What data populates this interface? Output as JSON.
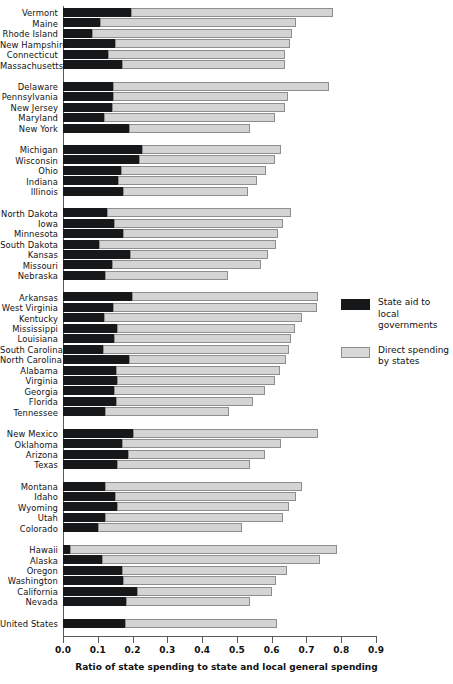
{
  "chart_data": {
    "type": "bar",
    "orientation": "horizontal",
    "stacked": true,
    "title": "",
    "xlabel": "Ratio of state spending to state and local general spending",
    "ylabel": "",
    "xlim": [
      0.0,
      0.9
    ],
    "xticks": [
      "0.0",
      "0.1",
      "0.2",
      "0.3",
      "0.4",
      "0.5",
      "0.6",
      "0.7",
      "0.8",
      "0.9"
    ],
    "grid": false,
    "legend_position": "right",
    "series": [
      {
        "name": "State aid to local governments",
        "color": "#17181a"
      },
      {
        "name": "Direct spending by states",
        "color": "#d4d4d4"
      }
    ],
    "groups": [
      {
        "name": "New England",
        "rows": [
          {
            "label": "Vermont",
            "aid": 0.195,
            "direct": 0.582,
            "total": 0.777
          },
          {
            "label": "Maine",
            "aid": 0.106,
            "direct": 0.564,
            "total": 0.67
          },
          {
            "label": "Rhode Island",
            "aid": 0.083,
            "direct": 0.575,
            "total": 0.658
          },
          {
            "label": "New Hampshire",
            "aid": 0.149,
            "direct": 0.503,
            "total": 0.652
          },
          {
            "label": "Connecticut",
            "aid": 0.13,
            "direct": 0.508,
            "total": 0.638
          },
          {
            "label": "Massachusetts",
            "aid": 0.17,
            "direct": 0.468,
            "total": 0.638
          }
        ]
      },
      {
        "name": "Mid-Atlantic",
        "rows": [
          {
            "label": "Delaware",
            "aid": 0.144,
            "direct": 0.621,
            "total": 0.765
          },
          {
            "label": "Pennsylvania",
            "aid": 0.144,
            "direct": 0.502,
            "total": 0.646
          },
          {
            "label": "New Jersey",
            "aid": 0.141,
            "direct": 0.497,
            "total": 0.638
          },
          {
            "label": "Maryland",
            "aid": 0.118,
            "direct": 0.492,
            "total": 0.61
          },
          {
            "label": "New York",
            "aid": 0.19,
            "direct": 0.348,
            "total": 0.538
          }
        ]
      },
      {
        "name": "Great Lakes",
        "rows": [
          {
            "label": "Michigan",
            "aid": 0.228,
            "direct": 0.399,
            "total": 0.627
          },
          {
            "label": "Wisconsin",
            "aid": 0.218,
            "direct": 0.392,
            "total": 0.61
          },
          {
            "label": "Ohio",
            "aid": 0.167,
            "direct": 0.417,
            "total": 0.584
          },
          {
            "label": "Indiana",
            "aid": 0.158,
            "direct": 0.4,
            "total": 0.558
          },
          {
            "label": "Illinois",
            "aid": 0.172,
            "direct": 0.36,
            "total": 0.532
          }
        ]
      },
      {
        "name": "Plains",
        "rows": [
          {
            "label": "North Dakota",
            "aid": 0.127,
            "direct": 0.528,
            "total": 0.655
          },
          {
            "label": "Iowa",
            "aid": 0.146,
            "direct": 0.486,
            "total": 0.632
          },
          {
            "label": "Minnesota",
            "aid": 0.172,
            "direct": 0.446,
            "total": 0.618
          },
          {
            "label": "South Dakota",
            "aid": 0.104,
            "direct": 0.508,
            "total": 0.612
          },
          {
            "label": "Kansas",
            "aid": 0.193,
            "direct": 0.396,
            "total": 0.589
          },
          {
            "label": "Missouri",
            "aid": 0.14,
            "direct": 0.43,
            "total": 0.57
          },
          {
            "label": "Nebraska",
            "aid": 0.12,
            "direct": 0.354,
            "total": 0.474
          }
        ]
      },
      {
        "name": "Southeast",
        "rows": [
          {
            "label": "Arkansas",
            "aid": 0.198,
            "direct": 0.535,
            "total": 0.733
          },
          {
            "label": "West Virginia",
            "aid": 0.143,
            "direct": 0.588,
            "total": 0.731
          },
          {
            "label": "Kentucky",
            "aid": 0.118,
            "direct": 0.57,
            "total": 0.688
          },
          {
            "label": "Mississippi",
            "aid": 0.155,
            "direct": 0.513,
            "total": 0.668
          },
          {
            "label": "Louisiana",
            "aid": 0.147,
            "direct": 0.509,
            "total": 0.656
          },
          {
            "label": "South Carolina",
            "aid": 0.115,
            "direct": 0.535,
            "total": 0.65
          },
          {
            "label": "North Carolina",
            "aid": 0.189,
            "direct": 0.451,
            "total": 0.64
          },
          {
            "label": "Alabama",
            "aid": 0.152,
            "direct": 0.473,
            "total": 0.625
          },
          {
            "label": "Virginia",
            "aid": 0.155,
            "direct": 0.454,
            "total": 0.609
          },
          {
            "label": "Georgia",
            "aid": 0.147,
            "direct": 0.435,
            "total": 0.582
          },
          {
            "label": "Florida",
            "aid": 0.152,
            "direct": 0.394,
            "total": 0.546
          },
          {
            "label": "Tennessee",
            "aid": 0.121,
            "direct": 0.355,
            "total": 0.476
          }
        ]
      },
      {
        "name": "Southwest",
        "rows": [
          {
            "label": "New Mexico",
            "aid": 0.2,
            "direct": 0.533,
            "total": 0.733
          },
          {
            "label": "Oklahoma",
            "aid": 0.17,
            "direct": 0.458,
            "total": 0.628
          },
          {
            "label": "Arizona",
            "aid": 0.187,
            "direct": 0.393,
            "total": 0.58
          },
          {
            "label": "Texas",
            "aid": 0.155,
            "direct": 0.384,
            "total": 0.539
          }
        ]
      },
      {
        "name": "Rocky Mountain",
        "rows": [
          {
            "label": "Montana",
            "aid": 0.121,
            "direct": 0.567,
            "total": 0.688
          },
          {
            "label": "Idaho",
            "aid": 0.15,
            "direct": 0.52,
            "total": 0.67
          },
          {
            "label": "Wyoming",
            "aid": 0.155,
            "direct": 0.495,
            "total": 0.65
          },
          {
            "label": "Utah",
            "aid": 0.12,
            "direct": 0.514,
            "total": 0.634
          },
          {
            "label": "Colorado",
            "aid": 0.102,
            "direct": 0.414,
            "total": 0.516
          }
        ]
      },
      {
        "name": "Far West",
        "rows": [
          {
            "label": "Hawaii",
            "aid": 0.019,
            "direct": 0.768,
            "total": 0.787
          },
          {
            "label": "Alaska",
            "aid": 0.111,
            "direct": 0.627,
            "total": 0.738
          },
          {
            "label": "Oregon",
            "aid": 0.17,
            "direct": 0.475,
            "total": 0.645
          },
          {
            "label": "Washington",
            "aid": 0.172,
            "direct": 0.441,
            "total": 0.613
          },
          {
            "label": "California",
            "aid": 0.212,
            "direct": 0.388,
            "total": 0.6
          },
          {
            "label": "Nevada",
            "aid": 0.18,
            "direct": 0.357,
            "total": 0.537
          }
        ]
      },
      {
        "name": "National",
        "rows": [
          {
            "label": "United States",
            "aid": 0.178,
            "direct": 0.437,
            "total": 0.615
          }
        ]
      }
    ]
  }
}
